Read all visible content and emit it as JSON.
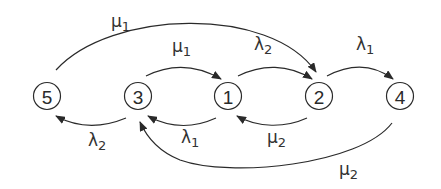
{
  "diagram": {
    "type": "state-transition",
    "nodes": [
      {
        "id": "5",
        "label": "5",
        "x": 47,
        "y": 96
      },
      {
        "id": "3",
        "label": "3",
        "x": 138,
        "y": 96
      },
      {
        "id": "1",
        "label": "1",
        "x": 228,
        "y": 96
      },
      {
        "id": "2",
        "label": "2",
        "x": 319,
        "y": 96
      },
      {
        "id": "4",
        "label": "4",
        "x": 400,
        "y": 96
      }
    ],
    "edges": [
      {
        "from": "5",
        "to": "2",
        "symbol": "μ",
        "sub": "1",
        "position": "top-long"
      },
      {
        "from": "3",
        "to": "1",
        "symbol": "μ",
        "sub": "1",
        "position": "top"
      },
      {
        "from": "1",
        "to": "2",
        "symbol": "λ",
        "sub": "2",
        "position": "top"
      },
      {
        "from": "2",
        "to": "4",
        "symbol": "λ",
        "sub": "1",
        "position": "top"
      },
      {
        "from": "3",
        "to": "5",
        "symbol": "λ",
        "sub": "2",
        "position": "bottom"
      },
      {
        "from": "1",
        "to": "3",
        "symbol": "λ",
        "sub": "1",
        "position": "bottom"
      },
      {
        "from": "2",
        "to": "1",
        "symbol": "μ",
        "sub": "2",
        "position": "bottom"
      },
      {
        "from": "4",
        "to": "3",
        "symbol": "μ",
        "sub": "2",
        "position": "bottom-long"
      }
    ]
  },
  "labels": {
    "e52": {
      "sym": "μ",
      "sub": "1"
    },
    "e31": {
      "sym": "μ",
      "sub": "1"
    },
    "e12": {
      "sym": "λ",
      "sub": "2"
    },
    "e24": {
      "sym": "λ",
      "sub": "1"
    },
    "e35": {
      "sym": "λ",
      "sub": "2"
    },
    "e13": {
      "sym": "λ",
      "sub": "1"
    },
    "e21": {
      "sym": "μ",
      "sub": "2"
    },
    "e43": {
      "sym": "μ",
      "sub": "2"
    }
  },
  "colors": {
    "stroke": "#2a2a2a",
    "text": "#333333",
    "background": "#ffffff"
  }
}
